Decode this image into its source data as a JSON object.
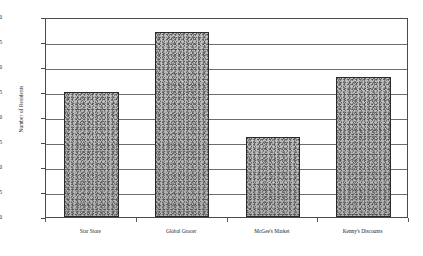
{
  "chart_data": {
    "type": "bar",
    "title": "",
    "xlabel": "",
    "ylabel": "Number of Residents",
    "categories": [
      "Star Store",
      "Global Grocer",
      "McGee's Market",
      "Kenny's Discounts"
    ],
    "values": [
      25,
      37,
      16,
      28
    ],
    "ylim": [
      0,
      40
    ],
    "ytick_step": 5,
    "yticks": [
      0,
      5,
      10,
      15,
      20,
      25,
      30,
      35,
      40
    ],
    "ytick_labels": [
      "0",
      "5",
      "10",
      "15",
      "20",
      "25",
      "30",
      "35",
      "40"
    ],
    "grid": true,
    "grid_axis": "y",
    "legend": false,
    "legend_position": "none",
    "bar_fill_color": "#b9b9b9",
    "bar_edge_color": "#2a2a2a",
    "gridline_color": "#6e6e6e",
    "axis_color": "#4a4a4a",
    "background_color": "#ffffff"
  }
}
